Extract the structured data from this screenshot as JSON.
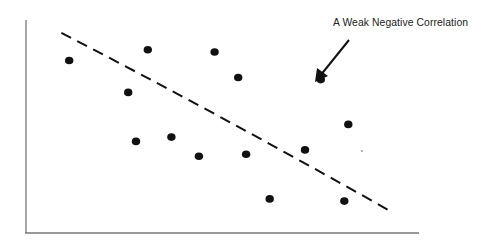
{
  "chart_data": {
    "type": "scatter",
    "title": "",
    "xlabel": "",
    "ylabel": "",
    "grid": false,
    "legend": null,
    "axes": {
      "show_ticks": false,
      "show_tick_labels": false
    },
    "xlim": [
      0,
      10
    ],
    "ylim": [
      0,
      10
    ],
    "points": [
      {
        "x": 1.1,
        "y": 8.1
      },
      {
        "x": 3.1,
        "y": 8.6
      },
      {
        "x": 4.8,
        "y": 8.5
      },
      {
        "x": 5.4,
        "y": 7.3
      },
      {
        "x": 7.5,
        "y": 7.2
      },
      {
        "x": 2.6,
        "y": 6.6
      },
      {
        "x": 8.2,
        "y": 5.1
      },
      {
        "x": 2.8,
        "y": 4.3
      },
      {
        "x": 3.7,
        "y": 4.5
      },
      {
        "x": 4.4,
        "y": 3.6
      },
      {
        "x": 5.6,
        "y": 3.7
      },
      {
        "x": 7.1,
        "y": 3.9
      },
      {
        "x": 6.2,
        "y": 1.6
      },
      {
        "x": 8.1,
        "y": 1.5
      }
    ],
    "trend_line": {
      "style": "dashed",
      "from": {
        "x": 0.9,
        "y": 9.4
      },
      "to": {
        "x": 9.2,
        "y": 1.1
      }
    },
    "annotations": [
      {
        "text": "A  Weak Negative Correlation",
        "arrow": true,
        "arrow_points_to": "trend_line"
      }
    ]
  },
  "annotation": {
    "label": "A  Weak Negative Correlation"
  },
  "colors": {
    "ink": "#111111",
    "axis": "#666666",
    "background": "#ffffff"
  }
}
